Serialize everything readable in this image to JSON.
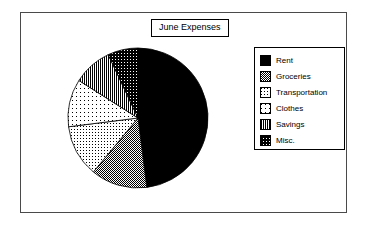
{
  "chart": {
    "title": "June Expenses",
    "center_x": 138,
    "center_y": 118,
    "radius": 70
  },
  "legend": {
    "items": [
      {
        "label": "Rent",
        "pattern": "solid-black",
        "color": "#000000"
      },
      {
        "label": "Groceries",
        "pattern": "dark-gray",
        "color": "#808080"
      },
      {
        "label": "Transportation",
        "pattern": "light-dots",
        "color": "#c8c8c8"
      },
      {
        "label": "Clothes",
        "pattern": "very-light-dots",
        "color": "#e8e8e8"
      },
      {
        "label": "Savings",
        "pattern": "vertical-lines",
        "color": "#9a9a9a"
      },
      {
        "label": "Misc.",
        "pattern": "crosshatch",
        "color": "#5a5a5a"
      }
    ]
  },
  "chart_data": {
    "type": "pie",
    "title": "June Expenses",
    "categories": [
      "Rent",
      "Groceries",
      "Transportation",
      "Clothes",
      "Savings",
      "Misc."
    ],
    "values": [
      48,
      13,
      12,
      11,
      9,
      7
    ],
    "units": "percent",
    "start_angle": 0,
    "direction": "clockwise",
    "legend_position": "right",
    "grid": false,
    "xlabel": "",
    "ylabel": ""
  }
}
